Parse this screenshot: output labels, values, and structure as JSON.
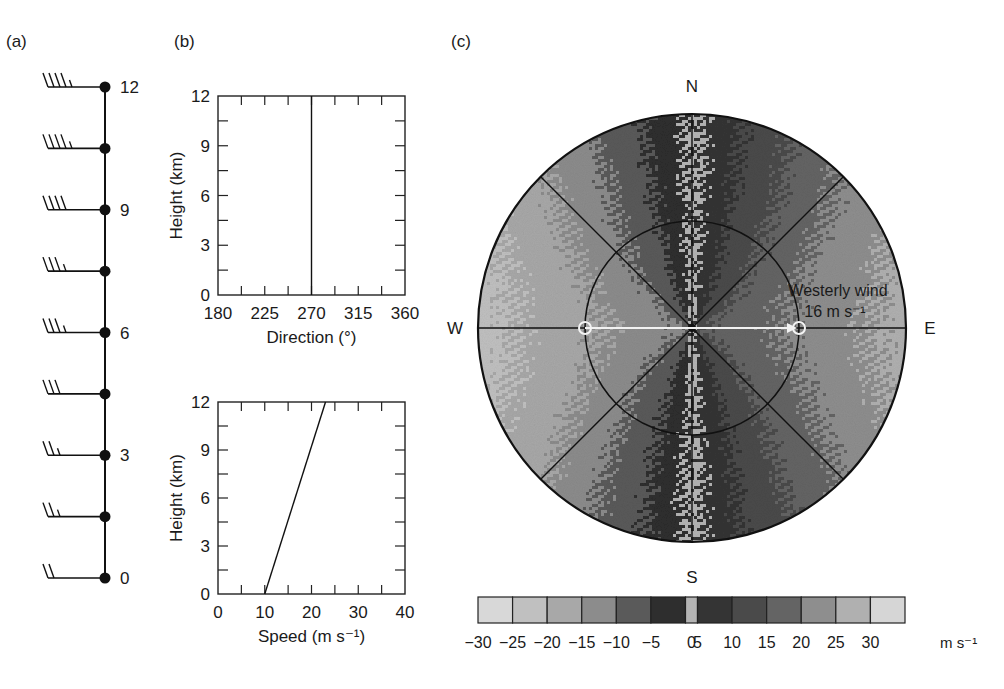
{
  "panels": {
    "a": {
      "label": "(a)"
    },
    "b": {
      "label": "(b)"
    },
    "c": {
      "label": "(c)"
    }
  },
  "chart_data": [
    {
      "type": "other",
      "subtype": "wind-barb-profile",
      "panel": "(a)",
      "title": "",
      "y_ticks": [
        "0",
        "3",
        "6",
        "9",
        "12"
      ],
      "heights_km": [
        0,
        1.5,
        3,
        4.5,
        6,
        7.5,
        9,
        10.5,
        12
      ],
      "barb_direction_deg": 270,
      "barb_speed_ms": [
        10,
        11.5,
        13,
        14.5,
        16,
        17.5,
        19,
        20.5,
        22
      ],
      "barb_full_count": [
        2,
        2,
        2,
        3,
        3,
        3,
        4,
        4,
        4
      ],
      "barb_half": [
        false,
        true,
        true,
        false,
        true,
        true,
        false,
        true,
        true
      ]
    },
    {
      "type": "line",
      "panel": "(b) top",
      "title": "",
      "xlabel": "Direction (°)",
      "ylabel": "Height (km)",
      "x_ticks": [
        "180",
        "225",
        "270",
        "315",
        "360"
      ],
      "y_ticks": [
        "0",
        "3",
        "6",
        "9",
        "12"
      ],
      "xlim": [
        180,
        360
      ],
      "ylim": [
        0,
        12
      ],
      "series": [
        {
          "name": "direction",
          "x": [
            270,
            270
          ],
          "y": [
            0,
            12
          ]
        }
      ]
    },
    {
      "type": "line",
      "panel": "(b) bottom",
      "title": "",
      "xlabel": "Speed (m s⁻¹)",
      "ylabel": "Height (km)",
      "x_ticks": [
        "0",
        "10",
        "20",
        "30",
        "40"
      ],
      "y_ticks": [
        "0",
        "3",
        "6",
        "9",
        "12"
      ],
      "xlim": [
        0,
        40
      ],
      "ylim": [
        0,
        12
      ],
      "series": [
        {
          "name": "speed",
          "x": [
            10,
            23
          ],
          "y": [
            0,
            12
          ]
        }
      ]
    },
    {
      "type": "heatmap",
      "subtype": "radial-velocity-ppi",
      "panel": "(c)",
      "compass": {
        "N": "N",
        "S": "S",
        "E": "E",
        "W": "W"
      },
      "annotation": {
        "line1": "Westerly wind",
        "line2": "16 m s⁻¹"
      },
      "range_rings": 2,
      "radials_deg": [
        0,
        45,
        90,
        135
      ],
      "colorbar": {
        "ticks": [
          "−30",
          "−25",
          "−20",
          "−15",
          "−10",
          "−5",
          "0",
          "5",
          "10",
          "15",
          "20",
          "25",
          "30"
        ],
        "unit": "m s⁻¹",
        "bins": [
          {
            "range": [
              -30,
              -25
            ],
            "color": "#d8d8d8"
          },
          {
            "range": [
              -25,
              -20
            ],
            "color": "#c0c0c0"
          },
          {
            "range": [
              -20,
              -15
            ],
            "color": "#a8a8a8"
          },
          {
            "range": [
              -15,
              -10
            ],
            "color": "#8c8c8c"
          },
          {
            "range": [
              -10,
              -5
            ],
            "color": "#5a5a5a"
          },
          {
            "range": [
              -5,
              -1
            ],
            "color": "#2e2e2e"
          },
          {
            "range": [
              -1,
              1
            ],
            "color": "#b4b4b4"
          },
          {
            "range": [
              1,
              5
            ],
            "color": "#343434"
          },
          {
            "range": [
              5,
              10
            ],
            "color": "#4a4a4a"
          },
          {
            "range": [
              10,
              15
            ],
            "color": "#646464"
          },
          {
            "range": [
              15,
              20
            ],
            "color": "#8e8e8e"
          },
          {
            "range": [
              20,
              25
            ],
            "color": "#b0b0b0"
          },
          {
            "range": [
              25,
              30
            ],
            "color": "#d6d6d6"
          }
        ]
      }
    }
  ]
}
